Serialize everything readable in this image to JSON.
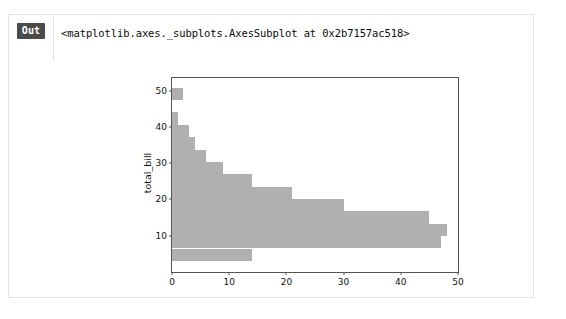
{
  "cell": {
    "prompt_label": "Out",
    "repr_text": "<matplotlib.axes._subplots.AxesSubplot at 0x2b7157ac518>"
  },
  "colors": {
    "bar": "#b0b0b0",
    "axes_edge": "#555555",
    "prompt_bg": "#4a4a4a",
    "prompt_fg": "#ffffff",
    "cell_border": "#e4e4e4",
    "background": "#ffffff"
  },
  "chart_data": {
    "type": "bar",
    "orientation": "horizontal",
    "title": "",
    "xlabel": "",
    "ylabel": "total_bill",
    "xlim": [
      0,
      50
    ],
    "ylim": [
      0,
      53.5
    ],
    "grid": false,
    "legend": null,
    "xticks": [
      0,
      10,
      20,
      30,
      40,
      50
    ],
    "yticks": [
      10,
      20,
      30,
      40,
      50
    ],
    "bin_edges": [
      3.07,
      6.48,
      9.89,
      13.3,
      16.71,
      20.12,
      23.53,
      26.94,
      30.35,
      33.76,
      37.17,
      40.58,
      43.99,
      47.4,
      50.81
    ],
    "bin_centers": [
      4.8,
      8.2,
      11.6,
      15.0,
      18.4,
      21.8,
      25.2,
      28.6,
      32.1,
      35.5,
      38.9,
      42.3,
      45.7,
      49.1
    ],
    "counts": [
      14,
      47,
      48,
      45,
      30,
      21,
      14,
      9,
      6,
      4,
      3,
      1,
      0,
      2
    ],
    "categories": [
      "3.07-6.48",
      "6.48-9.89",
      "9.89-13.30",
      "13.30-16.71",
      "16.71-20.12",
      "20.12-23.53",
      "23.53-26.94",
      "26.94-30.35",
      "30.35-33.76",
      "33.76-37.17",
      "37.17-40.58",
      "40.58-43.99",
      "43.99-47.40",
      "47.40-50.81"
    ],
    "values": [
      14,
      47,
      48,
      45,
      30,
      21,
      14,
      9,
      6,
      4,
      3,
      1,
      0,
      2
    ]
  }
}
